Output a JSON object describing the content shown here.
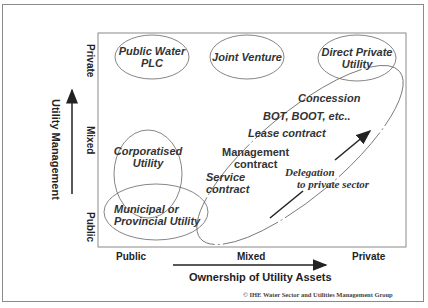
{
  "diagram": {
    "y_axis": {
      "title": "Utility Management",
      "ticks": [
        "Private",
        "Mixed",
        "Public"
      ]
    },
    "x_axis": {
      "title": "Ownership of Utility Assets",
      "ticks": [
        "Public",
        "Mixed",
        "Private"
      ]
    },
    "nodes": {
      "public_water_plc": {
        "line1": "Public Water",
        "line2": "PLC"
      },
      "joint_venture": {
        "line1": "Joint Venture"
      },
      "direct_private": {
        "line1": "Direct Private",
        "line2": "Utility"
      },
      "corporatised": {
        "line1": "Corporatised",
        "line2": "Utility"
      },
      "municipal": {
        "line1": "Municipal or",
        "line2": "Provincial Utility"
      }
    },
    "delegation_items": {
      "concession": "Concession",
      "bot": "BOT, BOOT, etc..",
      "lease": "Lease contract",
      "management1": "Management",
      "management2": "contract",
      "service1": "Service",
      "service2": "contract"
    },
    "delegation_arrow": {
      "line1": "Delegation",
      "line2": "to private sector"
    },
    "copyright": "© IHE Water Sector and Utilities Management Group"
  }
}
